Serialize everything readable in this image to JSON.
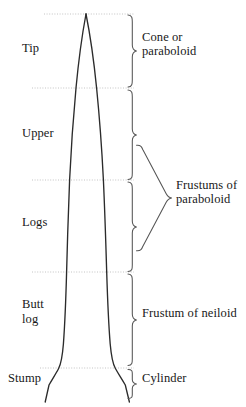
{
  "figure": {
    "type": "diagram",
    "canvas": {
      "width": 246,
      "height": 407,
      "background": "#ffffff"
    },
    "stroke_color": "#2b2b2b",
    "divider_color": "#bdbdbd",
    "bracket_color": "#555555"
  },
  "stem_labels": [
    {
      "key": "tip",
      "text": "Tip",
      "x": 22,
      "y": 41
    },
    {
      "key": "upper",
      "text": "Upper",
      "x": 22,
      "y": 126
    },
    {
      "key": "logs",
      "text": "Logs",
      "x": 22,
      "y": 215
    },
    {
      "key": "butt",
      "text": "Butt",
      "x": 22,
      "y": 297
    },
    {
      "key": "butt2",
      "text": "log",
      "x": 22,
      "y": 312
    },
    {
      "key": "stump",
      "text": "Stump",
      "x": 8,
      "y": 371
    }
  ],
  "solid_labels": [
    {
      "key": "cone",
      "line1": "Cone or",
      "line2": "paraboloid",
      "x": 142,
      "y": 30
    },
    {
      "key": "frustums",
      "line1": "Frustums of",
      "line2": "paraboloid",
      "x": 176,
      "y": 178
    },
    {
      "key": "neiloid",
      "line1": "Frustum of neiloid",
      "line2": "",
      "x": 142,
      "y": 306
    },
    {
      "key": "cylinder",
      "line1": "Cylinder",
      "line2": "",
      "x": 142,
      "y": 371
    }
  ],
  "section_boundaries_y": [
    14,
    88,
    180,
    272,
    368
  ],
  "brackets": [
    {
      "key": "cone-bracket",
      "top": 14,
      "bottom": 88,
      "label": "Cone or paraboloid"
    },
    {
      "key": "upper-bracket",
      "top": 90,
      "bottom": 180,
      "label": "Frustums of paraboloid"
    },
    {
      "key": "logs-bracket",
      "top": 182,
      "bottom": 272,
      "label": "Frustums of paraboloid"
    },
    {
      "key": "buttlog-bracket",
      "top": 274,
      "bottom": 366,
      "label": "Frustum of neiloid"
    },
    {
      "key": "stump-bracket",
      "top": 369,
      "bottom": 399,
      "label": "Cylinder"
    },
    {
      "key": "frustums-group-bracket",
      "top": 133,
      "bottom": 263,
      "label": "Frustums of paraboloid"
    }
  ]
}
